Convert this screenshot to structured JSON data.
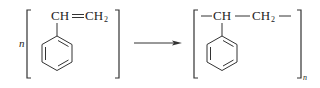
{
  "reaction": {
    "reactant": {
      "coefficient": "n",
      "group_left": "CH",
      "bond": "═",
      "group_right": "CH",
      "subscript": "2",
      "name": "styrene"
    },
    "arrow": "→",
    "product": {
      "dash1": "—",
      "group_left": "CH",
      "dash2": "—",
      "group_right": "CH",
      "subscript": "2",
      "dash3": "—",
      "repeat": "n",
      "name": "polystyrene"
    }
  }
}
